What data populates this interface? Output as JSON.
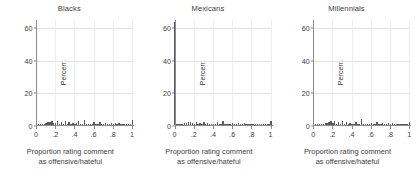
{
  "chart_data": {
    "type": "bar",
    "title": "",
    "xlabel": "Proportion rating comment as offensive/hateful",
    "xlabel_line1": "Proportion rating comment",
    "xlabel_line2": "as offensive/hateful",
    "ylabel": "Percent",
    "ylim": [
      0,
      65
    ],
    "xlim": [
      0,
      1
    ],
    "grid": true,
    "legend": "none",
    "ytick_labels": [
      "0",
      "20",
      "40",
      "60"
    ],
    "ytick_values": [
      0,
      20,
      40,
      60
    ],
    "xtick_labels": [
      "0",
      ".2",
      ".4",
      ".6",
      ".8",
      "1"
    ],
    "xtick_values": [
      0,
      0.2,
      0.4,
      0.6,
      0.8,
      1
    ],
    "bar_color": "#5a5a5a",
    "panels": [
      {
        "title": "Blacks",
        "x": [
          0.0,
          0.02,
          0.04,
          0.06,
          0.08,
          0.1,
          0.12,
          0.14,
          0.16,
          0.18,
          0.2,
          0.22,
          0.24,
          0.26,
          0.28,
          0.3,
          0.32,
          0.34,
          0.36,
          0.38,
          0.4,
          0.42,
          0.44,
          0.46,
          0.48,
          0.5,
          0.52,
          0.54,
          0.56,
          0.58,
          0.6,
          0.62,
          0.64,
          0.66,
          0.68,
          0.7,
          0.72,
          0.74,
          0.76,
          0.78,
          0.8,
          0.82,
          0.84,
          0.86,
          0.88,
          0.9,
          0.92,
          0.94,
          0.96,
          0.98,
          1.0
        ],
        "values": [
          42.0,
          0.3,
          0.4,
          0.6,
          0.9,
          1.2,
          1.6,
          2.0,
          2.4,
          1.5,
          1.0,
          2.3,
          0.9,
          1.8,
          0.8,
          2.6,
          0.9,
          1.9,
          0.7,
          1.2,
          0.6,
          1.0,
          2.2,
          0.5,
          0.7,
          3.3,
          0.6,
          0.5,
          0.9,
          0.4,
          1.6,
          0.7,
          0.5,
          1.8,
          0.6,
          0.5,
          1.5,
          0.6,
          0.4,
          1.3,
          0.5,
          1.2,
          0.4,
          1.0,
          0.4,
          0.9,
          0.3,
          0.6,
          0.3,
          0.4,
          3.1
        ],
        "peak_at_zero": 42.0,
        "peak_at_one": 3.1
      },
      {
        "title": "Mexicans",
        "x": [
          0.0,
          0.02,
          0.04,
          0.06,
          0.08,
          0.1,
          0.12,
          0.14,
          0.16,
          0.18,
          0.2,
          0.22,
          0.24,
          0.26,
          0.28,
          0.3,
          0.32,
          0.34,
          0.36,
          0.38,
          0.4,
          0.42,
          0.44,
          0.46,
          0.48,
          0.5,
          0.52,
          0.54,
          0.56,
          0.58,
          0.6,
          0.62,
          0.64,
          0.66,
          0.68,
          0.7,
          0.72,
          0.74,
          0.76,
          0.78,
          0.8,
          0.82,
          0.84,
          0.86,
          0.88,
          0.9,
          0.92,
          0.94,
          0.96,
          0.98,
          1.0
        ],
        "values": [
          63.0,
          0.2,
          0.3,
          0.5,
          0.7,
          1.0,
          1.3,
          1.7,
          2.0,
          1.2,
          0.8,
          1.9,
          0.7,
          1.4,
          0.6,
          2.1,
          0.7,
          1.5,
          0.5,
          0.9,
          0.5,
          0.8,
          1.7,
          0.4,
          0.5,
          2.5,
          0.5,
          0.4,
          0.7,
          0.3,
          1.2,
          0.5,
          0.4,
          1.3,
          0.5,
          0.4,
          1.1,
          0.4,
          0.3,
          0.9,
          0.4,
          0.9,
          0.3,
          0.8,
          0.3,
          0.7,
          0.2,
          0.5,
          0.2,
          0.3,
          2.4
        ],
        "peak_at_zero": 63.0,
        "peak_at_one": 2.4
      },
      {
        "title": "Millennials",
        "x": [
          0.0,
          0.02,
          0.04,
          0.06,
          0.08,
          0.1,
          0.12,
          0.14,
          0.16,
          0.18,
          0.2,
          0.22,
          0.24,
          0.26,
          0.28,
          0.3,
          0.32,
          0.34,
          0.36,
          0.38,
          0.4,
          0.42,
          0.44,
          0.46,
          0.48,
          0.5,
          0.52,
          0.54,
          0.56,
          0.58,
          0.6,
          0.62,
          0.64,
          0.66,
          0.68,
          0.7,
          0.72,
          0.74,
          0.76,
          0.78,
          0.8,
          0.82,
          0.84,
          0.86,
          0.88,
          0.9,
          0.92,
          0.94,
          0.96,
          0.98,
          1.0
        ],
        "values": [
          56.0,
          0.2,
          0.3,
          0.4,
          0.7,
          0.9,
          1.2,
          1.5,
          1.9,
          2.4,
          1.1,
          2.2,
          0.8,
          1.6,
          0.7,
          2.5,
          0.8,
          1.7,
          0.6,
          1.0,
          0.6,
          0.9,
          2.0,
          0.5,
          0.6,
          3.4,
          0.6,
          0.5,
          0.8,
          0.4,
          1.4,
          0.6,
          0.5,
          1.6,
          0.6,
          0.5,
          1.3,
          0.5,
          0.4,
          1.1,
          0.5,
          1.0,
          0.4,
          0.9,
          0.4,
          0.8,
          0.3,
          0.5,
          0.3,
          0.3,
          1.7
        ],
        "peak_at_zero": 56.0,
        "peak_at_one": 1.7
      }
    ]
  }
}
